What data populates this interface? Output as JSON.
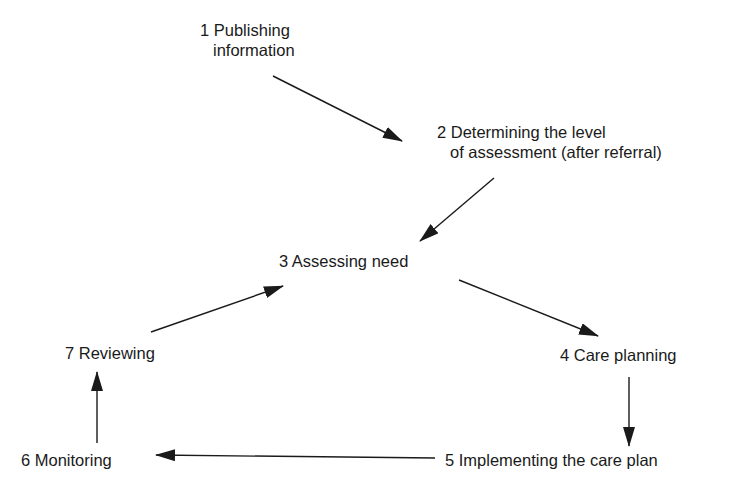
{
  "diagram": {
    "type": "cycle-flow",
    "nodes": [
      {
        "id": "n1",
        "number": "1",
        "lines": [
          "1 Publishing",
          "information"
        ]
      },
      {
        "id": "n2",
        "number": "2",
        "lines": [
          "2 Determining the level",
          "of assessment (after referral)"
        ]
      },
      {
        "id": "n3",
        "number": "3",
        "lines": [
          "3 Assessing need"
        ]
      },
      {
        "id": "n4",
        "number": "4",
        "lines": [
          "4 Care planning"
        ]
      },
      {
        "id": "n5",
        "number": "5",
        "lines": [
          "5 Implementing the care plan"
        ]
      },
      {
        "id": "n6",
        "number": "6",
        "lines": [
          "6 Monitoring"
        ]
      },
      {
        "id": "n7",
        "number": "7",
        "lines": [
          "7 Reviewing"
        ]
      }
    ],
    "edges": [
      {
        "from": "n1",
        "to": "n2"
      },
      {
        "from": "n2",
        "to": "n3"
      },
      {
        "from": "n3",
        "to": "n4"
      },
      {
        "from": "n4",
        "to": "n5"
      },
      {
        "from": "n5",
        "to": "n6"
      },
      {
        "from": "n6",
        "to": "n7"
      },
      {
        "from": "n7",
        "to": "n3"
      }
    ],
    "colors": {
      "ink": "#1a1a1a",
      "background": "#ffffff"
    }
  }
}
